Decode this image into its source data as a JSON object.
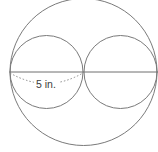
{
  "diagram": {
    "type": "geometry-figure",
    "measurement_label": "5 in.",
    "colors": {
      "stroke": "#7a7a7a",
      "text": "#3c3c3c",
      "background": "#ffffff"
    },
    "shapes": {
      "outer_circle": {
        "cx": 83.5,
        "cy": 72,
        "r": 74
      },
      "left_inner_circle": {
        "cx": 46.5,
        "cy": 72,
        "r": 37
      },
      "right_inner_circle": {
        "cx": 120.5,
        "cy": 72,
        "r": 37
      },
      "diameter_line": {
        "x1": 9.5,
        "y1": 72,
        "x2": 158,
        "y2": 72
      }
    }
  }
}
